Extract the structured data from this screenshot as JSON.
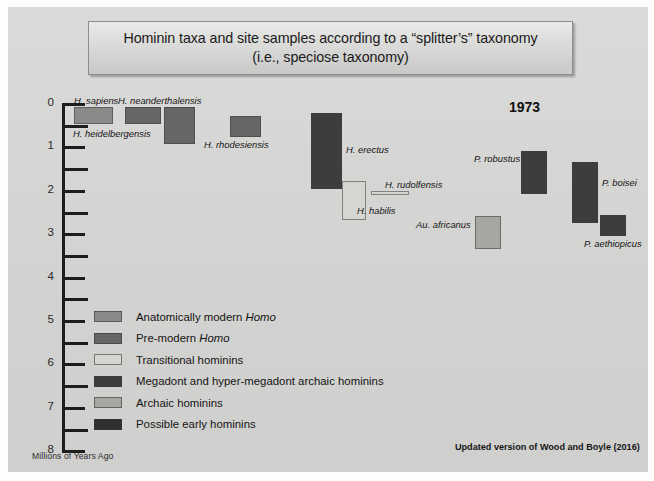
{
  "slide": {
    "title_line1": "Hominin taxa and site samples according to a “splitter’s” taxonomy",
    "title_line2": "(i.e., speciose taxonomy)",
    "year": "1973",
    "credit": "Updated version of Wood and Boyle (2016)",
    "axis_caption": "Millions of Years Ago"
  },
  "colors": {
    "slide_background": "#d6d6d4",
    "anatomically_modern_homo": "#8a8a88",
    "pre_modern_homo": "#666664",
    "transitional_hominins": "#d5d5d2",
    "megadont_archaic": "#3d3d3c",
    "archaic_hominins": "#a6a6a3",
    "possible_early_hominins": "#2e2e2d",
    "axis": "#1d1d1d"
  },
  "chart_data": {
    "type": "bar",
    "orientation": "vertical-range",
    "title": "Hominin taxa and site samples according to a “splitter’s” taxonomy (i.e., speciose taxonomy)",
    "ylabel": "Millions of Years Ago",
    "xlabel": "",
    "ylim": [
      0,
      8
    ],
    "y_inverted": true,
    "y_ticks_major": [
      0,
      1,
      2,
      3,
      4,
      5,
      6,
      7,
      8
    ],
    "y_ticks_minor": [
      0.5,
      1.5,
      2.5,
      3.5,
      4.5,
      5.5,
      6.5,
      7.5
    ],
    "y_tick_labels": [
      "0",
      "1",
      "2",
      "3",
      "4",
      "5",
      "6",
      "7",
      "8"
    ],
    "grid": false,
    "legend_position": "center-left",
    "annotations": [
      "1973",
      "Updated version of Wood and Boyle (2016)"
    ],
    "categories": [
      "H. sapiens",
      "H. neanderthalensis",
      "H. heidelbergensis",
      "H. rhodesiensis",
      "H. erectus",
      "H. habilis",
      "H. rudolfensis",
      "P. robustus",
      "Au. africanus",
      "P. boisei",
      "P. aethiopicus"
    ],
    "series": [
      {
        "name": "Anatomically modern Homo",
        "group": "anatomically_modern_homo",
        "taxa": [
          {
            "label": "H. sapiens",
            "from_mya": 0.05,
            "to_mya": 0.45
          }
        ]
      },
      {
        "name": "Pre-modern Homo",
        "group": "pre_modern_homo",
        "taxa": [
          {
            "label": "H. neanderthalensis",
            "from_mya": 0.05,
            "to_mya": 0.45
          },
          {
            "label": "H. heidelbergensis",
            "from_mya": 0.05,
            "to_mya": 0.85
          },
          {
            "label": "H. rhodesiensis",
            "from_mya": 0.5,
            "to_mya": 0.85
          }
        ]
      },
      {
        "name": "Megadont and hyper-megadont archaic hominins",
        "group": "megadont_archaic",
        "taxa": [
          {
            "label": "H. erectus",
            "from_mya": 0.25,
            "to_mya": 1.95
          },
          {
            "label": "P. robustus",
            "from_mya": 1.35,
            "to_mya": 2.25
          },
          {
            "label": "P. boisei",
            "from_mya": 1.45,
            "to_mya": 2.7
          },
          {
            "label": "P. aethiopicus",
            "from_mya": 2.35,
            "to_mya": 2.8
          }
        ]
      },
      {
        "name": "Transitional hominins",
        "group": "transitional_hominins",
        "taxa": [
          {
            "label": "H. habilis",
            "from_mya": 1.7,
            "to_mya": 2.55
          },
          {
            "label": "H. rudolfensis",
            "from_mya": 1.88,
            "to_mya": 1.96
          }
        ]
      },
      {
        "name": "Archaic hominins",
        "group": "archaic_hominins",
        "taxa": [
          {
            "label": "Au. africanus",
            "from_mya": 2.3,
            "to_mya": 3.0
          }
        ]
      }
    ]
  },
  "bars": [
    {
      "name": "h-sapiens",
      "group": "anatomically_modern_homo",
      "x": 66,
      "y": 100,
      "w": 39,
      "h": 17
    },
    {
      "name": "h-neanderthalensis",
      "group": "pre_modern_homo",
      "x": 117,
      "y": 100,
      "w": 36,
      "h": 17
    },
    {
      "name": "h-heidelbergensis",
      "group": "pre_modern_homo",
      "x": 156,
      "y": 100,
      "w": 31,
      "h": 37
    },
    {
      "name": "h-rhodesiensis",
      "group": "pre_modern_homo",
      "x": 222,
      "y": 109,
      "w": 31,
      "h": 21
    },
    {
      "name": "h-erectus",
      "group": "megadont_archaic",
      "x": 303,
      "y": 106,
      "w": 31,
      "h": 76
    },
    {
      "name": "h-habilis",
      "group": "transitional_hominins",
      "x": 334,
      "y": 174,
      "w": 24,
      "h": 39
    },
    {
      "name": "h-rudolfensis",
      "group": "transitional_hominins",
      "x": 363,
      "y": 184,
      "w": 38,
      "h": 4
    },
    {
      "name": "p-robustus",
      "group": "megadont_archaic",
      "x": 513,
      "y": 144,
      "w": 26,
      "h": 43
    },
    {
      "name": "au-africanus",
      "group": "archaic_hominins",
      "x": 467,
      "y": 209,
      "w": 26,
      "h": 33
    },
    {
      "name": "p-boisei",
      "group": "megadont_archaic",
      "x": 564,
      "y": 155,
      "w": 26,
      "h": 61
    },
    {
      "name": "p-aethiopicus",
      "group": "megadont_archaic",
      "x": 592,
      "y": 208,
      "w": 26,
      "h": 21
    }
  ],
  "taxon_labels": [
    {
      "name": "h-sapiens",
      "text": "H. sapiens",
      "x": 66,
      "y": 88
    },
    {
      "name": "h-neanderthalensis",
      "text": "H. neanderthalensis",
      "x": 110,
      "y": 88
    },
    {
      "name": "h-heidelbergensis",
      "text": "H. heidelbergensis",
      "x": 65,
      "y": 121
    },
    {
      "name": "h-rhodesiensis",
      "text": "H. rhodesiensis",
      "x": 196,
      "y": 132
    },
    {
      "name": "h-erectus",
      "text": "H. erectus",
      "x": 338,
      "y": 137
    },
    {
      "name": "h-habilis",
      "text": "H. habilis",
      "x": 349,
      "y": 198
    },
    {
      "name": "h-rudolfensis",
      "text": "H. rudolfensis",
      "x": 377,
      "y": 172
    },
    {
      "name": "p-robustus",
      "text": "P. robustus",
      "x": 466,
      "y": 146
    },
    {
      "name": "au-africanus",
      "text": "Au. africanus",
      "x": 408,
      "y": 212
    },
    {
      "name": "p-boisei",
      "text": "P. boisei",
      "x": 594,
      "y": 170
    },
    {
      "name": "p-aethiopicus",
      "text": "P. aethiopicus",
      "x": 576,
      "y": 231
    }
  ],
  "legend": {
    "items": [
      {
        "label": "Anatomically modern ",
        "italic": "Homo",
        "group": "anatomically_modern_homo"
      },
      {
        "label": "Pre-modern ",
        "italic": "Homo",
        "group": "pre_modern_homo"
      },
      {
        "label": "Transitional hominins",
        "italic": "",
        "group": "transitional_hominins"
      },
      {
        "label": "Megadont and hyper-megadont archaic hominins",
        "italic": "",
        "group": "megadont_archaic"
      },
      {
        "label": "Archaic hominins",
        "italic": "",
        "group": "archaic_hominins"
      },
      {
        "label": "Possible early hominins",
        "italic": "",
        "group": "possible_early_hominins"
      }
    ]
  }
}
